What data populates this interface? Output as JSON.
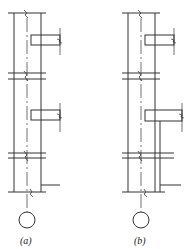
{
  "figure": {
    "panels": [
      {
        "id": "a",
        "label": "(a)",
        "description": "column with two beams and bottom stub, lower beam short"
      },
      {
        "id": "b",
        "label": "(b)",
        "description": "column with two beams, lower beam longer, and bottom stub"
      }
    ],
    "colors": {
      "line": "#333333",
      "background": "#ffffff"
    }
  }
}
